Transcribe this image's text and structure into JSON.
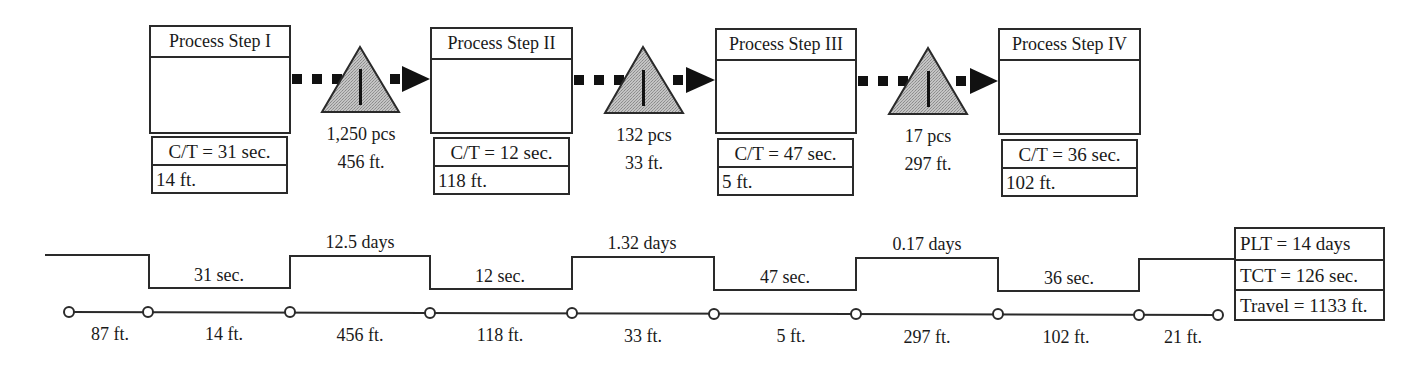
{
  "process_steps": [
    {
      "title": "Process Step I",
      "cycle_time": "C/T = 31 sec.",
      "distance": "14 ft."
    },
    {
      "title": "Process Step II",
      "cycle_time": "C/T = 12 sec.",
      "distance": "118 ft."
    },
    {
      "title": "Process Step III",
      "cycle_time": "C/T = 47 sec.",
      "distance": "5 ft."
    },
    {
      "title": "Process Step IV",
      "cycle_time": "C/T = 36 sec.",
      "distance": "102 ft."
    }
  ],
  "inventories": [
    {
      "icon": "inventory-triangle-icon",
      "quantity": "1,250 pcs",
      "distance": "456 ft."
    },
    {
      "icon": "inventory-triangle-icon",
      "quantity": "132 pcs",
      "distance": "33 ft."
    },
    {
      "icon": "inventory-triangle-icon",
      "quantity": "17 pcs",
      "distance": "297 ft."
    }
  ],
  "timeline": {
    "wait_times": [
      "12.5 days",
      "1.32 days",
      "0.17 days"
    ],
    "process_times": [
      "31 sec.",
      "12 sec.",
      "47 sec.",
      "36 sec."
    ]
  },
  "distance_line": {
    "segments": [
      "87 ft.",
      "14 ft.",
      "456 ft.",
      "118 ft.",
      "33 ft.",
      "5 ft.",
      "297 ft.",
      "102 ft.",
      "21 ft."
    ]
  },
  "summary": {
    "plt": "PLT = 14 days",
    "tct": "TCT = 126 sec.",
    "travel": "Travel = 1133 ft."
  },
  "colors": {
    "line": "#2a2a2a",
    "inventory_fill": "#b3b3b3",
    "arrow": "#111111"
  }
}
